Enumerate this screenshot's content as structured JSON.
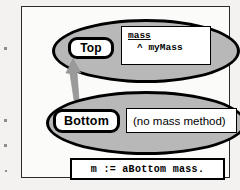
{
  "figure": {
    "kind": "inheritance-method-lookup-diagram",
    "classes": [
      {
        "name": "Top",
        "method": {
          "selector": "mass",
          "body": "^ myMass"
        }
      },
      {
        "name": "Bottom",
        "note": "(no mass method)"
      }
    ],
    "statement": "m := aBottom mass.",
    "arrow": {
      "name": "lookup-arrow",
      "direction": "up",
      "from": "Bottom",
      "to": "Top",
      "color": "#9a9a9a"
    },
    "colors": {
      "ellipse_fill": "#b8b8b8",
      "ellipse_stroke": "#000000",
      "box_fill": "#ffffff",
      "frame_stroke": "#2b2b2b",
      "page": "#f3f2f0"
    }
  }
}
